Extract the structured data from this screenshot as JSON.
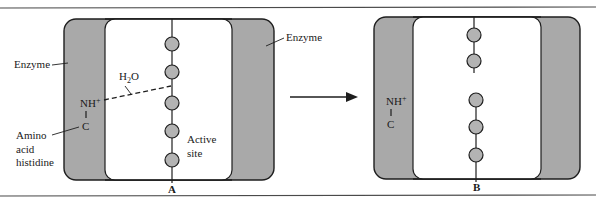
{
  "figure": {
    "colors": {
      "enzyme_fill": "#a9a9a9",
      "bead_fill": "#b3b3b3",
      "stroke": "#1e1e1e",
      "background": "#ffffff"
    },
    "panel_a": {
      "letter": "A",
      "labels": {
        "enzyme_left": "Enzyme",
        "enzyme_right": "Enzyme",
        "water": "H",
        "water_sub": "2",
        "water_tail": "O",
        "nh": "NH",
        "nh_sup": "+",
        "bond": "|",
        "carbon": "C",
        "amino_line1": "Amino",
        "amino_line2": "acid",
        "amino_line3": "histidine",
        "active_line1": "Active",
        "active_line2": "site"
      },
      "bead_count": 5
    },
    "arrow": {
      "direction": "right"
    },
    "panel_b": {
      "letter": "B",
      "labels": {
        "nh": "NH",
        "nh_sup": "+",
        "bond": "|",
        "carbon": "C"
      },
      "bead_count": 5,
      "strand_broken": true
    }
  }
}
